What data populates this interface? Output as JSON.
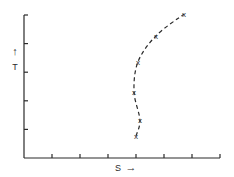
{
  "chart_data": {
    "type": "line",
    "title": "",
    "xlabel": "S",
    "ylabel": "T",
    "xlabel_arrow": "→",
    "ylabel_arrow": "↑",
    "x_ticks": 7,
    "y_ticks": 5,
    "xlim": [
      0,
      7
    ],
    "ylim": [
      0,
      5
    ],
    "grid": false,
    "tick_labels": false,
    "line_style": "dashed",
    "marker": "x",
    "series": [
      {
        "name": "S-T curve",
        "points": [
          {
            "x": 4.0,
            "y": 0.77
          },
          {
            "x": 4.14,
            "y": 1.33
          },
          {
            "x": 3.93,
            "y": 2.31
          },
          {
            "x": 4.07,
            "y": 3.36
          },
          {
            "x": 4.71,
            "y": 4.27
          },
          {
            "x": 5.71,
            "y": 5.03
          }
        ]
      }
    ]
  },
  "colors": {
    "ink": "#2a2a2a",
    "background": "#ffffff"
  }
}
